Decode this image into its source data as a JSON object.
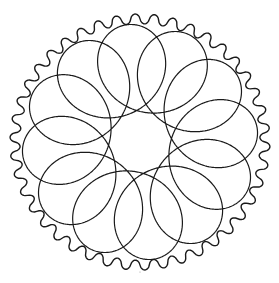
{
  "drawing": {
    "title": "Spirograph gear drawing",
    "background": "#ffffff",
    "ink_color": "#1a1a1a",
    "center": [
      140,
      142
    ],
    "gear": {
      "teeth": 42,
      "outer_radius": 130,
      "inner_radius": 120,
      "stroke_width": 1.4
    },
    "rosette": {
      "type": "hypotrochoid",
      "lobes": 12,
      "max_radius": 118,
      "min_radius": 30,
      "frequency_ratio": 7,
      "rotation_deg": -6,
      "stroke_width": 1.2
    },
    "speck": {
      "x": 140,
      "y": 272,
      "r": 0.6
    }
  }
}
